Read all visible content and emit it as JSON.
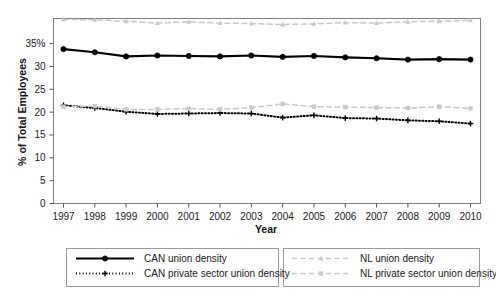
{
  "chart_data": {
    "type": "line",
    "title": "",
    "xlabel": "Year",
    "ylabel": "% of Total Employees",
    "x": [
      1997,
      1998,
      1999,
      2000,
      2001,
      2002,
      2003,
      2004,
      2005,
      2006,
      2007,
      2008,
      2009,
      2010
    ],
    "xlim": [
      1997,
      2010
    ],
    "ylim": [
      0,
      40.5
    ],
    "yticks": [
      0,
      5,
      10,
      15,
      20,
      25,
      30,
      35
    ],
    "ytick_labels": [
      "0",
      "5",
      "10",
      "15",
      "20",
      "25",
      "30",
      "35%"
    ],
    "xtick_labels": [
      "1997",
      "1998",
      "1999",
      "2000",
      "2001",
      "2002",
      "2003",
      "2004",
      "2005",
      "2006",
      "2007",
      "2008",
      "2009",
      "2010"
    ],
    "grid": false,
    "legend_position": "bottom",
    "series": [
      {
        "name": "CAN union density",
        "key": "can_union",
        "color": "#000000",
        "style": "solid",
        "marker": "circle",
        "values": [
          33.8,
          33.1,
          32.2,
          32.4,
          32.3,
          32.2,
          32.4,
          32.1,
          32.3,
          32.0,
          31.8,
          31.5,
          31.6,
          31.5
        ]
      },
      {
        "name": "CAN private sector union density",
        "key": "can_private",
        "color": "#000000",
        "style": "dotted",
        "marker": "plus",
        "values": [
          21.5,
          20.9,
          20.1,
          19.6,
          19.7,
          19.8,
          19.7,
          18.8,
          19.3,
          18.7,
          18.6,
          18.2,
          18.0,
          17.5
        ]
      },
      {
        "name": "NL union density",
        "key": "nl_union",
        "color": "#c9c9c9",
        "style": "dashed",
        "marker": "triangle",
        "values": [
          40.3,
          40.2,
          39.9,
          39.5,
          39.8,
          39.5,
          39.4,
          39.2,
          39.3,
          39.6,
          39.5,
          39.8,
          39.9,
          40.1
        ]
      },
      {
        "name": "NL private sector union density",
        "key": "nl_private",
        "color": "#c9c9c9",
        "style": "dashed",
        "marker": "square",
        "values": [
          21.2,
          21.3,
          20.6,
          20.6,
          20.8,
          20.6,
          21.0,
          21.8,
          21.2,
          21.1,
          21.0,
          20.9,
          21.2,
          20.8
        ]
      }
    ]
  },
  "axis": {
    "ylabel": "% of Total Employees",
    "xlabel": "Year"
  },
  "legend": {
    "items": [
      {
        "label": "CAN union density",
        "name": "legend-can-union"
      },
      {
        "label": "CAN private sector union density",
        "name": "legend-can-private"
      },
      {
        "label": "NL union density",
        "name": "legend-nl-union"
      },
      {
        "label": "NL private sector union density",
        "name": "legend-nl-private"
      }
    ]
  }
}
